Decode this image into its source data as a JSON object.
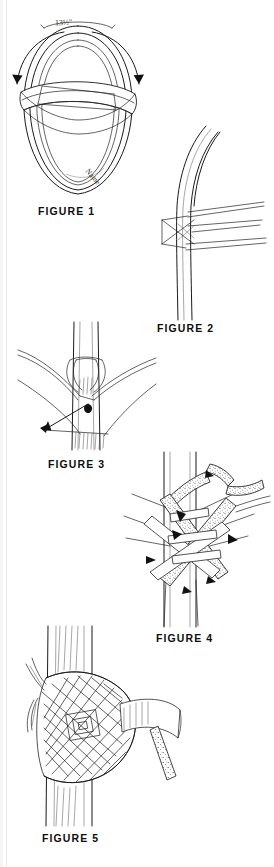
{
  "page": {
    "background_color": "#ffffff",
    "ink_color": "#1a1a1a",
    "width": 274,
    "height": 867,
    "document_type": "instructional-line-art-plate"
  },
  "figures": [
    {
      "id": "figure-1",
      "caption": "FIGURE 1",
      "annotations": [
        {
          "name": "length-dimension",
          "text": "13½\""
        },
        {
          "name": "name-marking",
          "text": "Name"
        }
      ],
      "description": "Oval leather loop with a crossing band and two curved direction arrows"
    },
    {
      "id": "figure-2",
      "caption": "FIGURE 2",
      "annotations": [],
      "description": "Vertical sapling with strap ends crossed behind it"
    },
    {
      "id": "figure-3",
      "caption": "FIGURE 3",
      "annotations": [],
      "description": "Strap crossed around the pole with pull-direction arrows"
    },
    {
      "id": "figure-4",
      "caption": "FIGURE 4",
      "annotations": [],
      "description": "Strands being interwoven around the pole"
    },
    {
      "id": "figure-5",
      "caption": "FIGURE 5",
      "annotations": [],
      "description": "Completed plaited weave wrapped around the pole"
    }
  ]
}
